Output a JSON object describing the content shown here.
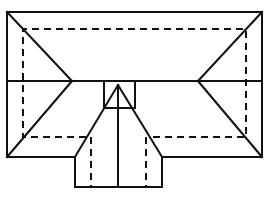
{
  "diagram": {
    "type": "roof-plan",
    "colors": {
      "line": "#111111",
      "background": "#ffffff"
    },
    "elements": {
      "outer_eave": {
        "x1": 7,
        "y1": 12,
        "x2": 262,
        "y2": 157
      },
      "inner_wall_dashed": {
        "x1": 23,
        "y1": 29,
        "x2": 246,
        "y2": 137
      },
      "ridge_y": 81,
      "left_hip_point": {
        "x": 72,
        "y": 81
      },
      "right_hip_point": {
        "x": 198,
        "y": 81
      },
      "wing": {
        "x1": 75,
        "x2": 162,
        "y_bottom": 187
      },
      "gable_peak": {
        "x": 118,
        "y": 85
      },
      "gable_box": {
        "x1": 104,
        "y1": 81,
        "x2": 135,
        "y2": 108
      },
      "wing_dashed_x": [
        91,
        144
      ]
    }
  }
}
